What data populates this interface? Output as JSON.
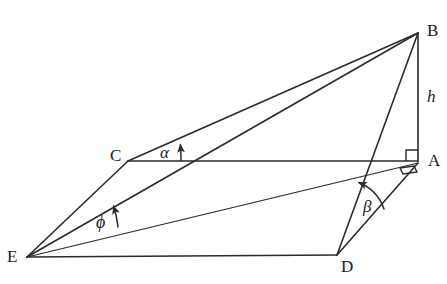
{
  "figure": {
    "kind": "geometry-diagram",
    "stroke_color": "#2b2b2b",
    "background_color": "#ffffff",
    "width": 447,
    "height": 284
  },
  "vertices": [
    {
      "id": "B",
      "label": "B",
      "x": 418,
      "y": 33,
      "label_x": 427,
      "label_y": 22
    },
    {
      "id": "A",
      "label": "A",
      "x": 418,
      "y": 161,
      "label_x": 428,
      "label_y": 152
    },
    {
      "id": "C",
      "label": "C",
      "x": 128,
      "y": 161,
      "label_x": 110,
      "label_y": 147
    },
    {
      "id": "E",
      "label": "E",
      "x": 27,
      "y": 257,
      "label_x": 7,
      "label_y": 248
    },
    {
      "id": "D",
      "label": "D",
      "x": 337,
      "y": 255,
      "label_x": 341,
      "label_y": 258
    }
  ],
  "edges": [
    {
      "id": "E-C",
      "from": "E",
      "to": "C",
      "weight": "med"
    },
    {
      "id": "C-B",
      "from": "C",
      "to": "B",
      "weight": "med"
    },
    {
      "id": "E-B",
      "from": "E",
      "to": "B",
      "weight": "med"
    },
    {
      "id": "C-A",
      "from": "C",
      "to": "A",
      "weight": "med"
    },
    {
      "id": "A-B",
      "from": "A",
      "to": "B",
      "weight": "med"
    },
    {
      "id": "E-A",
      "from": "E",
      "to": "A",
      "weight": "thin"
    },
    {
      "id": "E-D",
      "from": "E",
      "to": "D",
      "weight": "med"
    },
    {
      "id": "D-A",
      "from": "D",
      "to": "A",
      "weight": "med"
    },
    {
      "id": "D-B",
      "from": "D",
      "to": "B",
      "weight": "med"
    }
  ],
  "angles": [
    {
      "id": "alpha",
      "label": "α",
      "at_vertex": "C",
      "between": [
        "C-A",
        "C-B"
      ],
      "label_x": 160,
      "label_y": 144
    },
    {
      "id": "beta",
      "label": "β",
      "at_vertex": "D",
      "between": [
        "D-A",
        "D-B"
      ],
      "label_x": 363,
      "label_y": 198
    },
    {
      "id": "phi",
      "label": "ϕ",
      "at_vertex": "E",
      "between": [
        "E-A",
        "E-B"
      ],
      "label_x": 96,
      "label_y": 213
    }
  ],
  "length_labels": [
    {
      "id": "h",
      "label": "h",
      "on_edge": "A-B",
      "label_x": 427,
      "label_y": 88
    }
  ],
  "markers": [
    {
      "id": "right-angle-A-upper",
      "kind": "right-angle",
      "at_vertex": "A",
      "note": "square between CA and AB"
    },
    {
      "id": "right-angle-A-lower",
      "kind": "right-angle",
      "at_vertex": "A",
      "note": "small square between EA and DA"
    }
  ]
}
